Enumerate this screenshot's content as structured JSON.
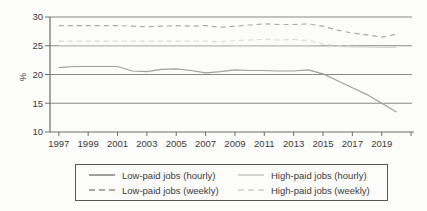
{
  "chart_data": {
    "type": "line",
    "title": "",
    "xlabel": "",
    "ylabel": "%",
    "ylim": [
      10,
      30
    ],
    "yticks": [
      10,
      15,
      20,
      25,
      30
    ],
    "xtick_years": [
      1997,
      1999,
      2001,
      2003,
      2005,
      2007,
      2009,
      2011,
      2013,
      2015,
      2017,
      2019
    ],
    "xtick_labels": [
      "1997",
      "1999",
      "2001",
      "2003",
      "2005",
      "2007",
      "2009",
      "2011",
      "2013",
      "2015",
      "2017",
      "2019"
    ],
    "unlabeled_tick_years": [
      2021
    ],
    "grid": true,
    "legend_position": "bottom",
    "axis_color": "#6d6d6d",
    "grid_color": "#898989",
    "text_color": "#3a3a3a",
    "x": [
      1997,
      1998,
      1999,
      2000,
      2001,
      2002,
      2003,
      2004,
      2005,
      2006,
      2007,
      2008,
      2009,
      2010,
      2011,
      2012,
      2013,
      2014,
      2015,
      2016,
      2017,
      2018,
      2019,
      2020
    ],
    "series": [
      {
        "name": "Low-paid jobs (hourly)",
        "style": "solid",
        "color": "#9f9f9f",
        "values": [
          21.2,
          21.4,
          21.4,
          21.4,
          21.4,
          20.6,
          20.5,
          20.9,
          21.0,
          20.7,
          20.3,
          20.5,
          20.8,
          20.7,
          20.7,
          20.6,
          20.6,
          20.8,
          20.1,
          18.9,
          17.7,
          16.5,
          15.0,
          13.5
        ]
      },
      {
        "name": "Low-paid jobs (weekly)",
        "style": "dashed",
        "color": "#a9a9a9",
        "values": [
          28.5,
          28.5,
          28.5,
          28.5,
          28.5,
          28.4,
          28.3,
          28.4,
          28.5,
          28.4,
          28.5,
          28.2,
          28.4,
          28.6,
          28.8,
          28.7,
          28.7,
          28.8,
          28.4,
          27.7,
          27.2,
          26.9,
          26.5,
          27.0
        ]
      },
      {
        "name": "High-paid jobs (hourly)",
        "style": "solid",
        "color": "#d3d3d3",
        "values": [
          25.0,
          25.0,
          25.0,
          25.0,
          25.0,
          25.0,
          25.0,
          25.0,
          25.0,
          25.0,
          25.0,
          25.0,
          25.0,
          25.0,
          25.0,
          25.0,
          25.0,
          25.0,
          24.9,
          24.9,
          24.8,
          24.8,
          24.7,
          24.7
        ]
      },
      {
        "name": "High-paid jobs (weekly)",
        "style": "dashed",
        "color": "#dadada",
        "values": [
          25.8,
          25.8,
          25.8,
          25.8,
          25.8,
          25.8,
          25.8,
          25.8,
          25.8,
          25.8,
          25.8,
          25.7,
          25.9,
          26.0,
          26.1,
          26.0,
          26.1,
          25.9,
          25.3,
          25.0,
          24.9,
          24.8,
          24.8,
          24.8
        ]
      }
    ]
  }
}
